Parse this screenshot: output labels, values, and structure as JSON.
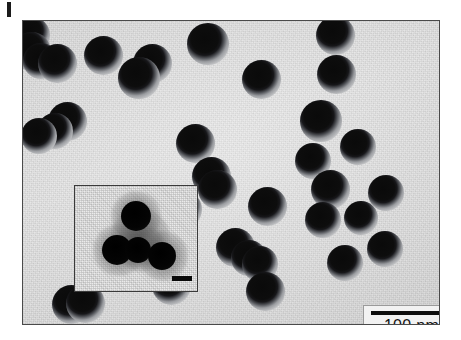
{
  "figure": {
    "type": "tem-micrograph",
    "label_mark": "",
    "background_color": "#e2e2e2",
    "frame_border_color": "#4a4a4a",
    "particle_core_color": "#0a0a0a",
    "particle_shell_color": "#9b9da1"
  },
  "scale_bar": {
    "label": "100 nm",
    "bar_length_px": 82,
    "box_background": "#f2f2f2",
    "line_color": "#0d0d0d"
  },
  "inset": {
    "scale_bar_label": "",
    "background_color": "#e6e6e6",
    "border_color": "#3a3a3a",
    "cores": [
      {
        "cx": 61,
        "cy": 30,
        "r": 15
      },
      {
        "cx": 42,
        "cy": 64,
        "r": 15
      },
      {
        "cx": 63,
        "cy": 64,
        "r": 13
      },
      {
        "cx": 87,
        "cy": 70,
        "r": 14
      }
    ],
    "coronas": [
      {
        "cx": 61,
        "cy": 30,
        "r": 25
      },
      {
        "cx": 44,
        "cy": 64,
        "r": 26
      },
      {
        "cx": 66,
        "cy": 62,
        "r": 24
      },
      {
        "cx": 88,
        "cy": 70,
        "r": 25
      },
      {
        "cx": 65,
        "cy": 52,
        "r": 30
      }
    ]
  },
  "particles": [
    {
      "cx": 9,
      "cy": 14,
      "r": 7.0
    },
    {
      "cx": 8,
      "cy": 30,
      "r": 7.5
    },
    {
      "cx": 18,
      "cy": 40,
      "r": 7.0
    },
    {
      "cx": 34,
      "cy": 42,
      "r": 7.5
    },
    {
      "cx": 80,
      "cy": 34,
      "r": 7.5
    },
    {
      "cx": 129,
      "cy": 42,
      "r": 7.5
    },
    {
      "cx": 116,
      "cy": 57,
      "r": 8.0
    },
    {
      "cx": 185,
      "cy": 23,
      "r": 8.0
    },
    {
      "cx": 238,
      "cy": 58,
      "r": 7.5
    },
    {
      "cx": 312,
      "cy": 14,
      "r": 7.5
    },
    {
      "cx": 313,
      "cy": 53,
      "r": 7.5
    },
    {
      "cx": 298,
      "cy": 100,
      "r": 8.0
    },
    {
      "cx": 44,
      "cy": 100,
      "r": 7.5
    },
    {
      "cx": 32,
      "cy": 110,
      "r": 7.0
    },
    {
      "cx": 16,
      "cy": 115,
      "r": 7.0
    },
    {
      "cx": 172,
      "cy": 122,
      "r": 7.5
    },
    {
      "cx": 290,
      "cy": 140,
      "r": 7.0
    },
    {
      "cx": 335,
      "cy": 126,
      "r": 7.0
    },
    {
      "cx": 307,
      "cy": 168,
      "r": 7.5
    },
    {
      "cx": 188,
      "cy": 155,
      "r": 7.5
    },
    {
      "cx": 194,
      "cy": 168,
      "r": 7.5
    },
    {
      "cx": 159,
      "cy": 188,
      "r": 7.5
    },
    {
      "cx": 244,
      "cy": 185,
      "r": 7.5
    },
    {
      "cx": 300,
      "cy": 199,
      "r": 7.0
    },
    {
      "cx": 338,
      "cy": 197,
      "r": 6.5
    },
    {
      "cx": 363,
      "cy": 172,
      "r": 7.0
    },
    {
      "cx": 362,
      "cy": 228,
      "r": 7.0
    },
    {
      "cx": 212,
      "cy": 226,
      "r": 7.5
    },
    {
      "cx": 226,
      "cy": 237,
      "r": 7.0
    },
    {
      "cx": 237,
      "cy": 243,
      "r": 7.0
    },
    {
      "cx": 85,
      "cy": 238,
      "r": 7.5
    },
    {
      "cx": 148,
      "cy": 264,
      "r": 7.5
    },
    {
      "cx": 242,
      "cy": 270,
      "r": 7.5
    },
    {
      "cx": 48,
      "cy": 283,
      "r": 7.5
    },
    {
      "cx": 62,
      "cy": 282,
      "r": 7.5
    },
    {
      "cx": 322,
      "cy": 242,
      "r": 7.0
    }
  ]
}
